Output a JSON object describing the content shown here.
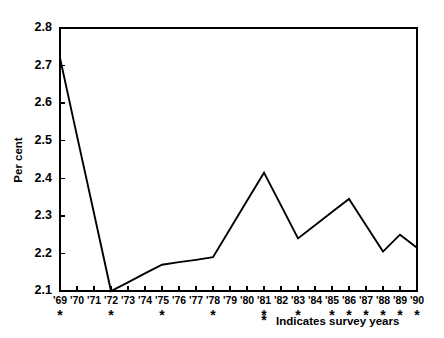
{
  "chart_data": {
    "type": "line",
    "title": "",
    "xlabel": "",
    "ylabel": "Per cent",
    "ylim": [
      2.1,
      2.8
    ],
    "y_ticks": [
      "2.1",
      "2.2",
      "2.3",
      "2.4",
      "2.5",
      "2.6",
      "2.7",
      "2.8"
    ],
    "y_tick_values": [
      2.1,
      2.2,
      2.3,
      2.4,
      2.5,
      2.6,
      2.7,
      2.8
    ],
    "grid": false,
    "legend_position": "bottom-right",
    "categories": [
      "'69",
      "'70",
      "'71",
      "'72",
      "'73",
      "'74",
      "'75",
      "'76",
      "'77",
      "'78",
      "'79",
      "'80",
      "'81",
      "'82",
      "'83",
      "'84",
      "'85",
      "'86",
      "'87",
      "'88",
      "'89",
      "'90"
    ],
    "x": [
      1969,
      1970,
      1971,
      1972,
      1973,
      1974,
      1975,
      1976,
      1977,
      1978,
      1979,
      1980,
      1981,
      1982,
      1983,
      1984,
      1985,
      1986,
      1987,
      1988,
      1989,
      1990
    ],
    "values": [
      2.72,
      2.513,
      2.307,
      2.1,
      2.123,
      2.147,
      2.17,
      2.177,
      2.183,
      2.19,
      2.265,
      2.34,
      2.415,
      2.328,
      2.24,
      2.275,
      2.31,
      2.345,
      2.275,
      2.205,
      2.25,
      2.215
    ],
    "vertex_years": [
      "'69",
      "'72",
      "'75",
      "'78",
      "'81",
      "'83",
      "'86",
      "'88",
      "'89",
      "'90"
    ],
    "vertex_values": [
      2.72,
      2.1,
      2.17,
      2.19,
      2.415,
      2.24,
      2.345,
      2.205,
      2.25,
      2.215
    ],
    "survey_years": [
      "'69",
      "'72",
      "'75",
      "'78",
      "'81",
      "'83",
      "'85",
      "'86",
      "'87",
      "'88",
      "'89",
      "'90"
    ],
    "survey_marker": "*",
    "legend_marker": "*",
    "legend_label": "Indicates survey years",
    "line_color": "#000000",
    "axis_color": "#000000",
    "background_color": "#ffffff"
  }
}
